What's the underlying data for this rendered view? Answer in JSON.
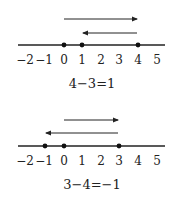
{
  "diagrams": [
    {
      "ticks": [
        "−2",
        "−1",
        "0",
        "1",
        "2",
        "3",
        "4",
        "5"
      ],
      "points": [
        0,
        1,
        4
      ],
      "arrows": [
        {
          "from": 0,
          "to": 4
        },
        {
          "from": 4,
          "to": 1
        }
      ],
      "equation": "4−3=1"
    },
    {
      "ticks": [
        "−2",
        "−1",
        "0",
        "1",
        "2",
        "3",
        "4",
        "5"
      ],
      "points": [
        -1,
        0,
        3
      ],
      "arrows": [
        {
          "from": 0,
          "to": 3
        },
        {
          "from": 3,
          "to": -1
        }
      ],
      "equation": "3−4=−1"
    }
  ]
}
